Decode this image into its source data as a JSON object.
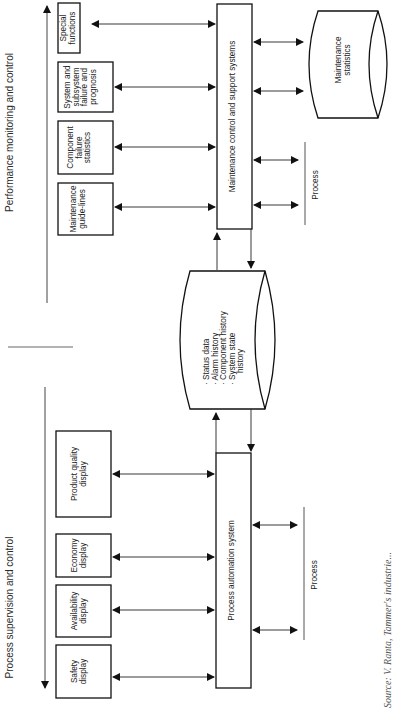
{
  "sections": {
    "top_heading": "Performance monitoring and control",
    "bottom_heading": "Process supervision and control"
  },
  "maintenance_side": {
    "boxes": [
      {
        "id": "special-functions",
        "lines": [
          "Special",
          "functions"
        ]
      },
      {
        "id": "system-subsystem-failure",
        "lines": [
          "System and",
          "subsystem",
          "failure and",
          "prognosis"
        ]
      },
      {
        "id": "component-failure-statistics",
        "lines": [
          "Component",
          "failure",
          "statistics"
        ]
      },
      {
        "id": "maintenance-guidelines",
        "lines": [
          "Maintenance",
          "guide-lines"
        ]
      }
    ],
    "central_system": "Maintenance control  and support systems",
    "database": {
      "lines": [
        "Maintenance",
        "statistics"
      ]
    },
    "process_label": "Process"
  },
  "shared_database": {
    "lines": [
      "· Status data",
      "· Alarm history",
      "· Component history",
      "· System state",
      "  history"
    ]
  },
  "automation_side": {
    "boxes": [
      {
        "id": "product-quality-display",
        "lines": [
          "Product quality",
          "display"
        ]
      },
      {
        "id": "economy-display",
        "lines": [
          "Economy",
          "display"
        ]
      },
      {
        "id": "availability-display",
        "lines": [
          "Availability",
          "display"
        ]
      },
      {
        "id": "safety-display",
        "lines": [
          "Safety",
          "display"
        ]
      }
    ],
    "central_system": "Process automation system",
    "process_label": "Process"
  },
  "caption": "Source: V. Ranta, Tammer's industrie..."
}
